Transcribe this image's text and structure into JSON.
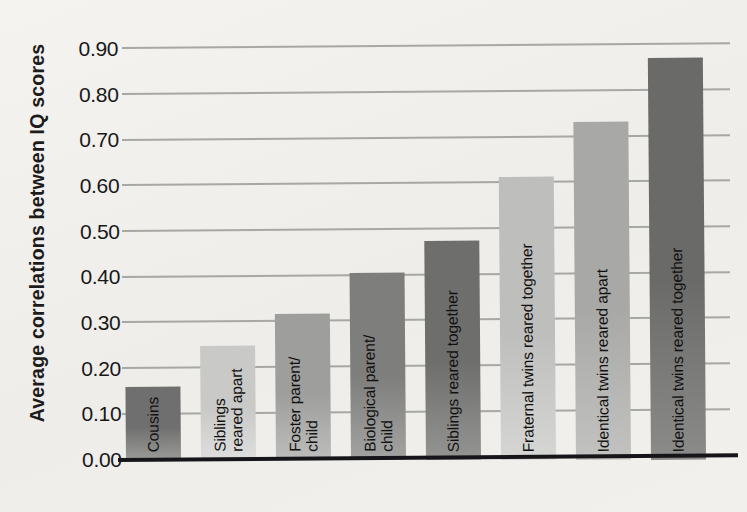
{
  "chart": {
    "type": "bar",
    "y_axis_title": "Average correlations between IQ scores",
    "background_color": "#f1f0ec",
    "baseline_color": "#16161a",
    "gridline_color": "#9a9a98"
  },
  "chart_data": {
    "type": "bar",
    "title": "",
    "xlabel": "",
    "ylabel": "Average correlations between IQ scores",
    "ylim": [
      0.0,
      0.95
    ],
    "grid": true,
    "legend": "none",
    "yticks": [
      "0.00",
      "0.10",
      "0.20",
      "0.30",
      "0.40",
      "0.50",
      "0.60",
      "0.70",
      "0.80",
      "0.90"
    ],
    "ytick_values": [
      0.0,
      0.1,
      0.2,
      0.3,
      0.4,
      0.5,
      0.6,
      0.7,
      0.8,
      0.9
    ],
    "categories": [
      "Cousins",
      "Siblings reared apart",
      "Foster parent/child",
      "Biological parent/child",
      "Siblings reared together",
      "Fraternal twins reared together",
      "Identical twins reared apart",
      "Identical twins reared together"
    ],
    "values": [
      0.16,
      0.25,
      0.32,
      0.41,
      0.48,
      0.62,
      0.74,
      0.88
    ],
    "bar_colors": [
      "#6f6f6f",
      "#c6c6c4",
      "#9b9b99",
      "#7b7b79",
      "#6d6d6b",
      "#bdbdbb",
      "#a6a6a4",
      "#6b6b69"
    ]
  },
  "bars": [
    {
      "label_line1": "Cousins",
      "label_line2": "",
      "value": 0.16,
      "color": "#6f6f6f",
      "color_bottom": "#9a9a98"
    },
    {
      "label_line1": "Siblings",
      "label_line2": "reared apart",
      "value": 0.25,
      "color": "#c9c9c7",
      "color_bottom": "#dedede"
    },
    {
      "label_line1": "Foster parent/",
      "label_line2": "child",
      "value": 0.32,
      "color": "#9e9e9c",
      "color_bottom": "#bdbdbb"
    },
    {
      "label_line1": "Biological parent/",
      "label_line2": "child",
      "value": 0.41,
      "color": "#7e7e7c",
      "color_bottom": "#a3a3a1"
    },
    {
      "label_line1": "Siblings reared together",
      "label_line2": "",
      "value": 0.48,
      "color": "#6e6e6c",
      "color_bottom": "#949492"
    },
    {
      "label_line1": "Fraternal twins reared together",
      "label_line2": "",
      "value": 0.62,
      "color": "#bebebc",
      "color_bottom": "#d6d6d4"
    },
    {
      "label_line1": "Identical twins reared apart",
      "label_line2": "",
      "value": 0.74,
      "color": "#a8a8a6",
      "color_bottom": "#c2c2c0"
    },
    {
      "label_line1": "Identical twins reared together",
      "label_line2": "",
      "value": 0.88,
      "color": "#6a6a68",
      "color_bottom": "#8b8b89"
    }
  ]
}
